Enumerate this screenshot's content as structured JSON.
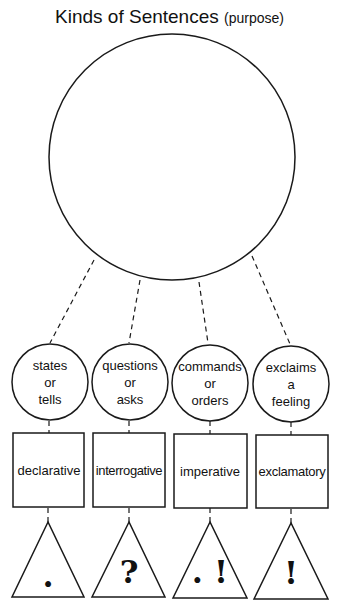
{
  "title": {
    "main": "Kinds of Sentences",
    "sub": "(purpose)"
  },
  "central_circle": {
    "label": ""
  },
  "kinds": [
    {
      "purpose_lines": [
        "states",
        "or",
        "tells"
      ],
      "name": "declarative",
      "punctuation": "."
    },
    {
      "purpose_lines": [
        "questions",
        "or",
        "asks"
      ],
      "name": "interrogative",
      "punctuation": "?"
    },
    {
      "purpose_lines": [
        "commands",
        "or",
        "orders"
      ],
      "name": "imperative",
      "punctuation": ". !"
    },
    {
      "purpose_lines": [
        "exclaims",
        "a",
        "feeling"
      ],
      "name": "exclamatory",
      "punctuation": "!"
    }
  ],
  "colors": {
    "line": "#1a1a1a",
    "background": "#ffffff"
  }
}
